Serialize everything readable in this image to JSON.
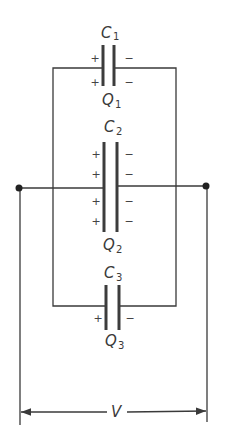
{
  "diagram": {
    "capacitors": [
      {
        "name": "C",
        "sub": "1",
        "charge": "Q",
        "charge_sub": "1",
        "plus": [
          "+",
          "+"
        ],
        "minus": [
          "−",
          "−"
        ]
      },
      {
        "name": "C",
        "sub": "2",
        "charge": "Q",
        "charge_sub": "2",
        "plus": [
          "+",
          "+",
          "+",
          "+"
        ],
        "minus": [
          "−",
          "−",
          "−",
          "−"
        ]
      },
      {
        "name": "C",
        "sub": "3",
        "charge": "Q",
        "charge_sub": "3",
        "plus": [
          "+"
        ],
        "minus": [
          "−"
        ]
      }
    ],
    "voltage_label": "V",
    "colors": {
      "line": "#3a3a3a",
      "background": "#ffffff"
    }
  }
}
